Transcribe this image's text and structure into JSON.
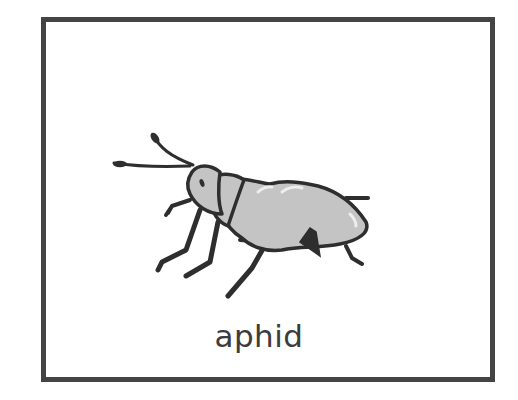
{
  "card": {
    "label": "aphid",
    "illustration": "aphid-icon"
  },
  "colors": {
    "frame": "#444444",
    "outline": "#2e2e2e",
    "body_fill": "#c4c4c4",
    "highlight": "#eeeeee",
    "text": "#3c3c3c",
    "background": "#ffffff"
  }
}
